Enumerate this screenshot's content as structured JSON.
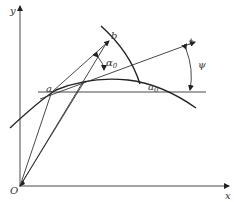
{
  "diagram": {
    "type": "geometric-construction",
    "axes": {
      "x_label": "x",
      "y_label": "y",
      "origin_label": "O"
    },
    "points": {
      "a": "a",
      "b": "b",
      "a0": "a",
      "a0_sub": "0",
      "t": "t"
    },
    "angles": {
      "alpha0": "α",
      "alpha0_sub": "0",
      "psi": "ψ"
    },
    "colors": {
      "stroke": "#333333",
      "background": "#ffffff"
    }
  }
}
